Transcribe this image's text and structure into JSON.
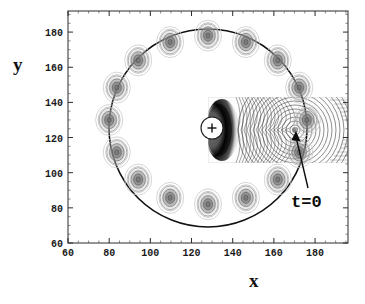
{
  "figure": {
    "title": "",
    "xlabel": "x",
    "ylabel": "y",
    "annotation": "t=0",
    "plus_marker": "+",
    "frame_color": "#2b2b2b",
    "curve_color": "#111111",
    "background": "#ffffff"
  },
  "chart_data": {
    "type": "scatter",
    "title": "",
    "xlabel": "x",
    "ylabel": "y",
    "xlim": [
      60,
      196
    ],
    "ylim": [
      60,
      192
    ],
    "xticks": [
      60,
      80,
      100,
      120,
      140,
      160,
      180
    ],
    "yticks": [
      60,
      80,
      100,
      120,
      140,
      160,
      180
    ],
    "xtick_labels": [
      "60",
      "80",
      "100",
      "120",
      "140",
      "160",
      "180"
    ],
    "ytick_labels": [
      "60",
      "80",
      "100",
      "120",
      "140",
      "160",
      "180"
    ],
    "grid": false,
    "legend": null,
    "frame": "full-box-with-ticks",
    "annotations": [
      {
        "text": "t=0",
        "x": 166,
        "y": 73,
        "arrow_to_x": 170,
        "arrow_to_y": 129,
        "description": "arrow pointing to the wave-source blob on the ring"
      }
    ],
    "series": [
      {
        "name": "ring-trajectory",
        "type": "line",
        "closed": true,
        "shape": "circle",
        "center": [
          128,
          130
        ],
        "radius": 48,
        "color": "#111111",
        "linewidth": 1.6
      },
      {
        "name": "gaussian-blobs",
        "type": "contour-blobs",
        "count": 16,
        "contour_rings_per_blob": 4,
        "center": [
          128,
          130
        ],
        "radius": 48,
        "points": [
          [
            176.0,
            130.0
          ],
          [
            172.3,
            148.4
          ],
          [
            161.9,
            163.9
          ],
          [
            146.4,
            174.3
          ],
          [
            128.0,
            178.0
          ],
          [
            109.6,
            174.3
          ],
          [
            94.1,
            163.9
          ],
          [
            83.7,
            148.4
          ],
          [
            80.0,
            130.0
          ],
          [
            83.7,
            111.6
          ],
          [
            94.1,
            96.1
          ],
          [
            109.6,
            85.7
          ],
          [
            128.0,
            82.0
          ],
          [
            146.4,
            85.7
          ],
          [
            161.9,
            96.1
          ],
          [
            172.3,
            111.6
          ]
        ]
      },
      {
        "name": "center-source",
        "type": "marker",
        "marker": "plus-in-disk",
        "x": 128,
        "y": 128,
        "label": "+"
      },
      {
        "name": "field-contour-patch",
        "type": "contour",
        "xrange": [
          118,
          196
        ],
        "yrange": [
          110,
          147
        ],
        "description": "dense wavy field contours with dark crescent left of source and concentric wavefronts around the t=0 blob"
      },
      {
        "name": "wavefront-source",
        "type": "contour-center",
        "x": 170,
        "y": 129,
        "rings": 13
      }
    ]
  }
}
